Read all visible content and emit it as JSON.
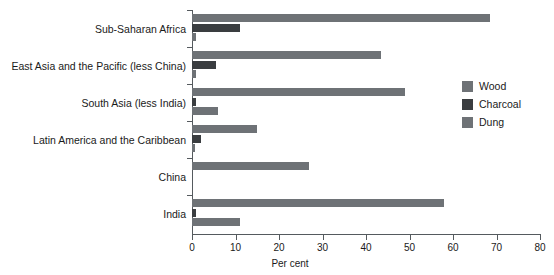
{
  "chart_data": {
    "type": "bar",
    "orientation": "horizontal",
    "title": "",
    "xlabel": "Per cent",
    "ylabel": "",
    "xlim": [
      0,
      80
    ],
    "xticks": [
      0,
      10,
      20,
      30,
      40,
      50,
      60,
      70,
      80
    ],
    "grid": false,
    "legend_position": "right",
    "categories": [
      "Sub-Saharan Africa",
      "East Asia and the Pacific (less China)",
      "South Asia (less India)",
      "Latin America and the Caribbean",
      "China",
      "India"
    ],
    "series": [
      {
        "name": "Wood",
        "color": "#6e7276",
        "values": [
          68.5,
          43.5,
          49.0,
          15.0,
          27.0,
          58.0
        ]
      },
      {
        "name": "Charcoal",
        "color": "#3a3d40",
        "values": [
          11.0,
          5.5,
          1.0,
          2.0,
          0.0,
          1.0
        ]
      },
      {
        "name": "Dung",
        "color": "#6e7276",
        "values": [
          1.0,
          1.0,
          6.0,
          0.8,
          0.0,
          11.0
        ]
      }
    ]
  },
  "axis": {
    "tick_labels": [
      "0",
      "10",
      "20",
      "30",
      "40",
      "50",
      "60",
      "70",
      "80"
    ],
    "x_title": "Per cent"
  },
  "legend": {
    "items": [
      {
        "label": "Wood",
        "color": "#6e7276"
      },
      {
        "label": "Charcoal",
        "color": "#3a3d40"
      },
      {
        "label": "Dung",
        "color": "#6e7276"
      }
    ]
  }
}
